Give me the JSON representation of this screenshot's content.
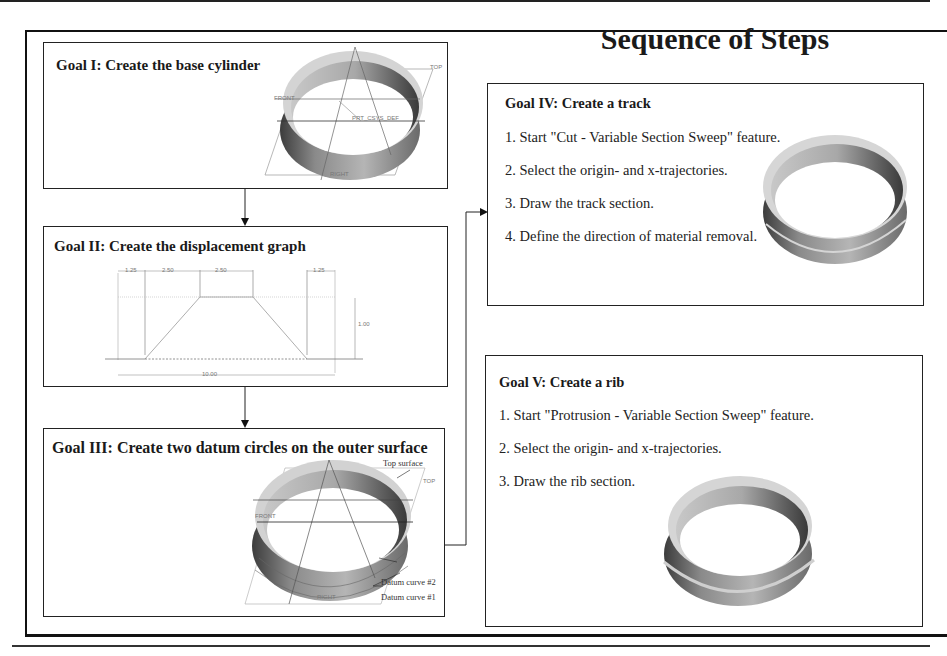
{
  "page": {
    "title": "Sequence of Steps"
  },
  "goals": [
    {
      "id": "goal-1",
      "title": "Goal I: Create the base cylinder",
      "figure": "base-cylinder-with-datum-planes",
      "figure_labels": [
        "FRONT",
        "PRT_CSYS_DEF",
        "TOP",
        "RIGHT"
      ]
    },
    {
      "id": "goal-2",
      "title": "Goal II: Create the displacement graph",
      "figure": "displacement-graph-trapezoid",
      "dimensions": {
        "segment_1": "1.25",
        "segment_2": "2.50",
        "segment_3": "2.50",
        "segment_4": "1.25",
        "height": "1.00",
        "total_length": "10.00"
      }
    },
    {
      "id": "goal-3",
      "title": "Goal III: Create two datum circles on the outer surface",
      "figure": "cylinder-with-datum-curves",
      "callouts": [
        "Top surface",
        "Datum curve #2",
        "Datum curve #1"
      ],
      "figure_labels": [
        "FRONT",
        "TOP",
        "RIGHT"
      ]
    },
    {
      "id": "goal-4",
      "title": "Goal IV: Create a track",
      "steps": [
        "1. Start \"Cut - Variable Section Sweep\" feature.",
        "2. Select the origin- and x-trajectories.",
        "3. Draw the track section.",
        "4. Define the direction of material removal."
      ],
      "figure": "cylinder-with-track"
    },
    {
      "id": "goal-5",
      "title": "Goal V: Create a rib",
      "steps": [
        "1. Start \"Protrusion - Variable Section Sweep\" feature.",
        "2. Select the origin- and x-trajectories.",
        "3. Draw the rib section."
      ],
      "figure": "cylinder-with-rib"
    }
  ],
  "flow": [
    {
      "from": "goal-1",
      "to": "goal-2"
    },
    {
      "from": "goal-2",
      "to": "goal-3"
    },
    {
      "from": "goal-3",
      "to": "goal-4"
    }
  ],
  "colors": {
    "line": "#222222",
    "shade_dark": "#555555",
    "shade_light": "#d8d8d8",
    "datum_line": "#888888"
  }
}
